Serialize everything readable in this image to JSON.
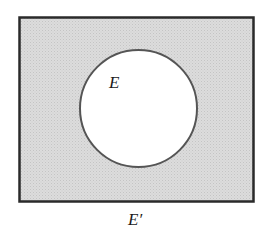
{
  "diagram": {
    "type": "venn",
    "universe": {
      "shading": "#d6d6d6",
      "border": "#2a2a2a"
    },
    "set": {
      "label": "E",
      "fill": "#ffffff",
      "border": "#555555"
    },
    "complement_label": "E′"
  }
}
